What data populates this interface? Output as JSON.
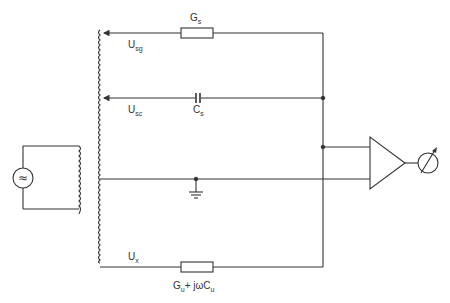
{
  "diagram": {
    "type": "circuit-schematic",
    "labels": {
      "gs": {
        "main": "G",
        "sub": "s"
      },
      "usg": {
        "main": "U",
        "sub": "sg"
      },
      "usc": {
        "main": "U",
        "sub": "sc"
      },
      "cs": {
        "main": "C",
        "sub": "s"
      },
      "ux": {
        "main": "U",
        "sub": "x"
      },
      "gu_main": "G",
      "gu_sub": "u",
      "gu_mid": "+ jωC",
      "gu_sub2": "u"
    },
    "components": [
      {
        "name": "ac-source",
        "symbol": "≈"
      },
      {
        "name": "transformer"
      },
      {
        "name": "resistor-gs"
      },
      {
        "name": "capacitor-cs"
      },
      {
        "name": "ground"
      },
      {
        "name": "amplifier"
      },
      {
        "name": "meter"
      },
      {
        "name": "impedance-gu-cu"
      }
    ],
    "colors": {
      "line": "#333333",
      "background": "#ffffff"
    }
  }
}
